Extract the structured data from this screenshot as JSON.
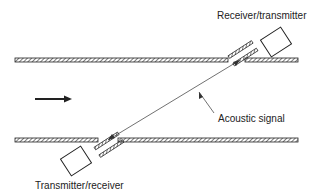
{
  "diagram": {
    "type": "ultrasonic-transit-time-flowmeter",
    "labels": {
      "top_transducer": "Receiver/transmitter",
      "bottom_transducer": "Transmitter/receiver",
      "signal": "Acoustic signal"
    },
    "flow_direction": "left-to-right",
    "colors": {
      "line": "#222222",
      "background": "#ffffff"
    }
  }
}
